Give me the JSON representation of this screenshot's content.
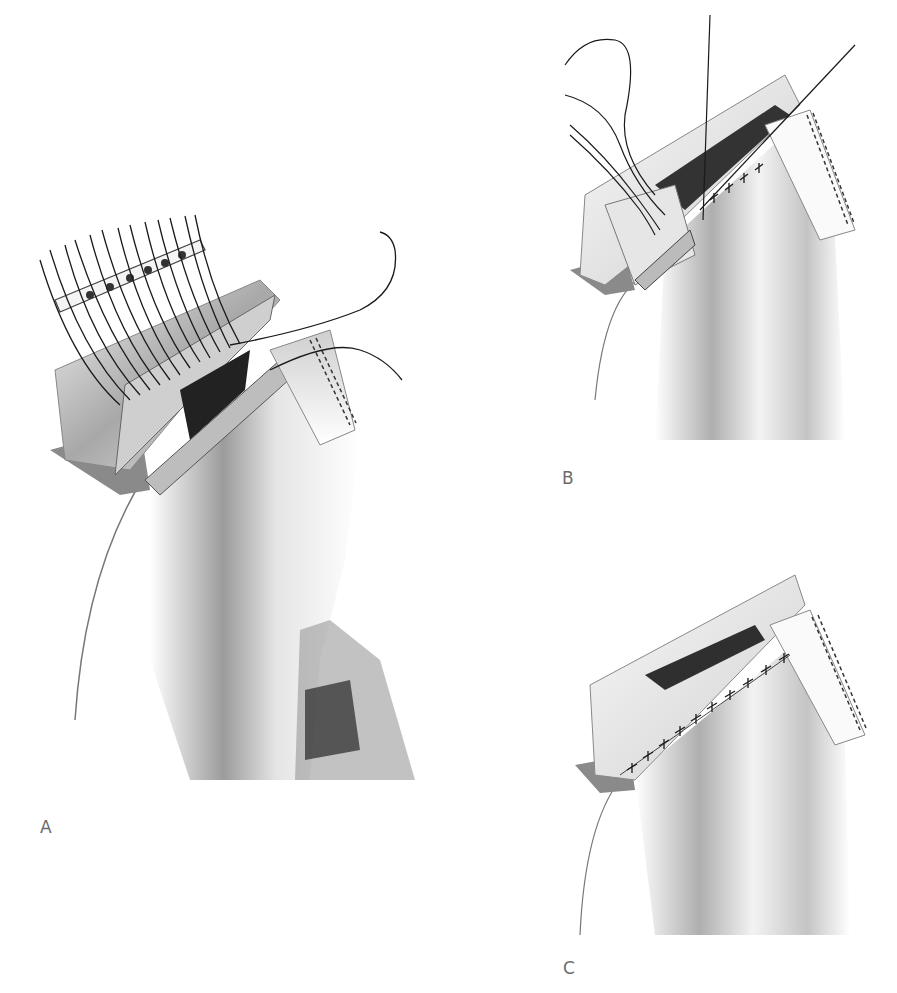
{
  "figure": {
    "type": "surgical illustration sequence",
    "style": "grayscale shaded drawing",
    "panels": [
      {
        "id": "A",
        "label": "A",
        "depicts": "multiple interrupted sutures placed through tissue flap held on a bolster tube, curved needle with suture passing through the wound edge"
      },
      {
        "id": "B",
        "label": "B",
        "depicts": "sutures being tied along the wound edge, several suture ends remaining, interrupted stitches along the closed portion"
      },
      {
        "id": "C",
        "label": "C",
        "depicts": "completed closure with a row of interrupted stitches along the wound edge"
      }
    ],
    "colors": {
      "background": "#ffffff",
      "label": "#6b6b6b",
      "suture": "#1a1a1a",
      "tissue_dark": "#3a3a3a",
      "tissue_mid": "#9a9a9a",
      "tissue_light": "#e6e6e6"
    }
  }
}
